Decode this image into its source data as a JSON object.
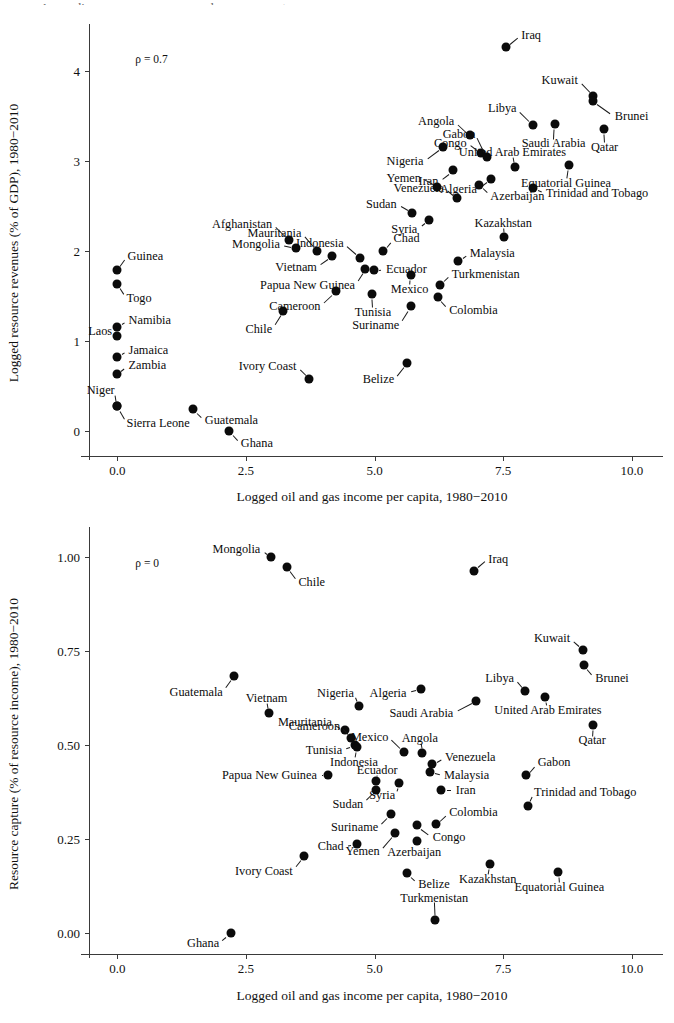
{
  "figure": {
    "cropped_title_sliver": "Appendix: resource revenues and resource capture"
  },
  "charts": [
    {
      "id": "top",
      "rho_label": "ρ = 0.7",
      "xlabel": "Logged oil and gas income per capita, 1980−2010",
      "ylabel": "Logged resource revenues (% of GDP), 1980−2010",
      "xticks": [
        "0.0",
        "2.5",
        "5.0",
        "7.5",
        "10.0"
      ],
      "yticks": [
        "0",
        "1",
        "2",
        "3",
        "4"
      ]
    },
    {
      "id": "bottom",
      "rho_label": "ρ = 0",
      "xlabel": "Logged oil and gas income per capita, 1980−2010",
      "ylabel": "Resource capture (% of resource income), 1980−2010",
      "xticks": [
        "0.0",
        "2.5",
        "5.0",
        "7.5",
        "10.0"
      ],
      "yticks": [
        "0.00",
        "0.25",
        "0.50",
        "0.75",
        "1.00"
      ]
    }
  ],
  "chart_data": [
    {
      "type": "scatter",
      "id": "logged-resource-revenues",
      "title": "",
      "xlabel": "Logged oil and gas income per capita, 1980−2010",
      "ylabel": "Logged resource revenues (% of GDP), 1980−2010",
      "xlim": [
        -0.55,
        10.45
      ],
      "ylim": [
        -0.28,
        4.45
      ],
      "xticks": [
        0.0,
        2.5,
        5.0,
        7.5,
        10.0
      ],
      "yticks": [
        0,
        1,
        2,
        3,
        4
      ],
      "grid": false,
      "legend": null,
      "annotations": [
        {
          "text": "ρ = 0.7",
          "x": 0.35,
          "y": 4.2
        }
      ],
      "points": [
        {
          "label": "Iraq",
          "x": 7.55,
          "y": 4.26,
          "lx": 0.3,
          "ly": 0.14,
          "anchor": "w"
        },
        {
          "label": "Kuwait",
          "x": 9.25,
          "y": 3.72,
          "lx": -0.3,
          "ly": 0.18,
          "anchor": "e"
        },
        {
          "label": "Brunei",
          "x": 9.25,
          "y": 3.66,
          "lx": 0.42,
          "ly": -0.17,
          "anchor": "w"
        },
        {
          "label": "Libya",
          "x": 8.08,
          "y": 3.4,
          "lx": -0.32,
          "ly": 0.18,
          "anchor": "e"
        },
        {
          "label": "Saudi Arabia",
          "x": 8.5,
          "y": 3.41,
          "lx": -0.02,
          "ly": -0.22,
          "anchor": "c"
        },
        {
          "label": "Qatar",
          "x": 9.45,
          "y": 3.35,
          "lx": 0.02,
          "ly": -0.2,
          "anchor": "c"
        },
        {
          "label": "Angola",
          "x": 6.85,
          "y": 3.28,
          "lx": -0.3,
          "ly": 0.16,
          "anchor": "e"
        },
        {
          "label": "Congo",
          "x": 7.07,
          "y": 3.08,
          "lx": -0.28,
          "ly": 0.12,
          "anchor": "e"
        },
        {
          "label": "Gabon",
          "x": 7.18,
          "y": 3.04,
          "lx": -0.22,
          "ly": 0.26,
          "anchor": "e"
        },
        {
          "label": "Nigeria",
          "x": 6.33,
          "y": 3.15,
          "lx": -0.38,
          "ly": -0.16,
          "anchor": "e"
        },
        {
          "label": "United Arab Emirates",
          "x": 7.73,
          "y": 2.93,
          "lx": -0.05,
          "ly": 0.16,
          "anchor": "c"
        },
        {
          "label": "Equatorial Guinea",
          "x": 8.77,
          "y": 2.95,
          "lx": -0.05,
          "ly": -0.2,
          "anchor": "c"
        },
        {
          "label": "Algeria",
          "x": 7.27,
          "y": 2.8,
          "lx": -0.28,
          "ly": -0.12,
          "anchor": "e"
        },
        {
          "label": "Azerbaijan",
          "x": 7.03,
          "y": 2.73,
          "lx": 0.22,
          "ly": -0.12,
          "anchor": "w"
        },
        {
          "label": "Iran",
          "x": 6.52,
          "y": 2.89,
          "lx": -0.28,
          "ly": -0.12,
          "anchor": "e"
        },
        {
          "label": "Yemen",
          "x": 6.22,
          "y": 2.71,
          "lx": -0.32,
          "ly": 0.1,
          "anchor": "e"
        },
        {
          "label": "Trinidad and Tobago",
          "x": 8.08,
          "y": 2.7,
          "lx": 0.25,
          "ly": -0.06,
          "anchor": "w"
        },
        {
          "label": "Venezuela",
          "x": 6.6,
          "y": 2.58,
          "lx": -0.25,
          "ly": 0.12,
          "anchor": "e"
        },
        {
          "label": "Sudan",
          "x": 5.73,
          "y": 2.42,
          "lx": -0.3,
          "ly": 0.1,
          "anchor": "e"
        },
        {
          "label": "Syria",
          "x": 6.05,
          "y": 2.34,
          "lx": -0.22,
          "ly": -0.1,
          "anchor": "e"
        },
        {
          "label": "Kazakhstan",
          "x": 7.52,
          "y": 2.15,
          "lx": -0.02,
          "ly": 0.16,
          "anchor": "c"
        },
        {
          "label": "Afghanistan",
          "x": 3.33,
          "y": 2.12,
          "lx": -0.32,
          "ly": 0.18,
          "anchor": "e"
        },
        {
          "label": "Mongolia",
          "x": 3.48,
          "y": 2.03,
          "lx": -0.32,
          "ly": 0.04,
          "anchor": "e"
        },
        {
          "label": "Mauritania",
          "x": 3.88,
          "y": 2.0,
          "lx": -0.3,
          "ly": 0.2,
          "anchor": "e"
        },
        {
          "label": "Vietnam",
          "x": 4.18,
          "y": 1.94,
          "lx": -0.3,
          "ly": -0.12,
          "anchor": "e"
        },
        {
          "label": "Indonesia",
          "x": 4.72,
          "y": 1.92,
          "lx": -0.32,
          "ly": 0.16,
          "anchor": "e"
        },
        {
          "label": "Chad",
          "x": 5.17,
          "y": 2.0,
          "lx": 0.2,
          "ly": 0.14,
          "anchor": "w"
        },
        {
          "label": "Guinea",
          "x": 0.0,
          "y": 1.78,
          "lx": 0.2,
          "ly": 0.16,
          "anchor": "w"
        },
        {
          "label": "Togo",
          "x": 0.0,
          "y": 1.63,
          "lx": 0.18,
          "ly": -0.16,
          "anchor": "w"
        },
        {
          "label": "Ecuador",
          "x": 4.98,
          "y": 1.78,
          "lx": 0.24,
          "ly": 0.02,
          "anchor": "w"
        },
        {
          "label": "Malaysia",
          "x": 6.63,
          "y": 1.88,
          "lx": 0.22,
          "ly": 0.09,
          "anchor": "w"
        },
        {
          "label": "Papua New Guinea",
          "x": 4.82,
          "y": 1.8,
          "lx": -0.2,
          "ly": -0.18,
          "anchor": "e"
        },
        {
          "label": "Mexico",
          "x": 5.7,
          "y": 1.73,
          "lx": -0.02,
          "ly": -0.16,
          "anchor": "c"
        },
        {
          "label": "Turkmenistan",
          "x": 6.28,
          "y": 1.62,
          "lx": 0.22,
          "ly": 0.12,
          "anchor": "w"
        },
        {
          "label": "Namibia",
          "x": 0.0,
          "y": 1.15,
          "lx": 0.22,
          "ly": 0.08,
          "anchor": "w"
        },
        {
          "label": "Laos",
          "x": 0.0,
          "y": 1.05,
          "lx": -0.1,
          "ly": 0.06,
          "anchor": "e"
        },
        {
          "label": "Cameroon",
          "x": 4.25,
          "y": 1.55,
          "lx": -0.3,
          "ly": -0.16,
          "anchor": "e"
        },
        {
          "label": "Tunisia",
          "x": 4.95,
          "y": 1.52,
          "lx": 0.02,
          "ly": -0.2,
          "anchor": "c"
        },
        {
          "label": "Colombia",
          "x": 6.23,
          "y": 1.48,
          "lx": 0.22,
          "ly": -0.14,
          "anchor": "w"
        },
        {
          "label": "Chile",
          "x": 3.23,
          "y": 1.33,
          "lx": -0.22,
          "ly": -0.2,
          "anchor": "e"
        },
        {
          "label": "Suriname",
          "x": 5.7,
          "y": 1.38,
          "lx": -0.22,
          "ly": -0.2,
          "anchor": "e"
        },
        {
          "label": "Jamaica",
          "x": 0.0,
          "y": 0.82,
          "lx": 0.22,
          "ly": 0.08,
          "anchor": "w"
        },
        {
          "label": "Zambia",
          "x": 0.0,
          "y": 0.63,
          "lx": 0.22,
          "ly": 0.1,
          "anchor": "w"
        },
        {
          "label": "Belize",
          "x": 5.63,
          "y": 0.75,
          "lx": -0.25,
          "ly": -0.18,
          "anchor": "e"
        },
        {
          "label": "Ivory Coast",
          "x": 3.73,
          "y": 0.58,
          "lx": -0.25,
          "ly": 0.14,
          "anchor": "e"
        },
        {
          "label": "Niger",
          "x": 0.0,
          "y": 0.27,
          "lx": -0.05,
          "ly": 0.18,
          "anchor": "e"
        },
        {
          "label": "Sierra Leone",
          "x": 0.0,
          "y": 0.27,
          "lx": 0.18,
          "ly": -0.18,
          "anchor": "w"
        },
        {
          "label": "Guatemala",
          "x": 1.48,
          "y": 0.24,
          "lx": 0.22,
          "ly": -0.12,
          "anchor": "w"
        },
        {
          "label": "Ghana",
          "x": 2.18,
          "y": 0.0,
          "lx": 0.22,
          "ly": -0.14,
          "anchor": "w"
        }
      ]
    },
    {
      "type": "scatter",
      "id": "resource-capture",
      "title": "",
      "xlabel": "Logged oil and gas income per capita, 1980−2010",
      "ylabel": "Resource capture (% of resource income), 1980−2010",
      "xlim": [
        -0.55,
        10.45
      ],
      "ylim": [
        -0.055,
        1.065
      ],
      "xticks": [
        0.0,
        2.5,
        5.0,
        7.5,
        10.0
      ],
      "yticks": [
        0.0,
        0.25,
        0.5,
        0.75,
        1.0
      ],
      "grid": false,
      "legend": null,
      "annotations": [
        {
          "text": "ρ = 0",
          "x": 0.35,
          "y": 1.0
        }
      ],
      "points": [
        {
          "label": "Mongolia",
          "x": 2.98,
          "y": 1.0,
          "lx": -0.2,
          "ly": 0.022,
          "anchor": "e"
        },
        {
          "label": "Chile",
          "x": 3.3,
          "y": 0.975,
          "lx": 0.22,
          "ly": -0.04,
          "anchor": "w"
        },
        {
          "label": "Iraq",
          "x": 6.93,
          "y": 0.965,
          "lx": 0.28,
          "ly": 0.032,
          "anchor": "w"
        },
        {
          "label": "Kuwait",
          "x": 9.05,
          "y": 0.755,
          "lx": -0.25,
          "ly": 0.03,
          "anchor": "e"
        },
        {
          "label": "Brunei",
          "x": 9.07,
          "y": 0.715,
          "lx": 0.22,
          "ly": -0.035,
          "anchor": "w"
        },
        {
          "label": "Guatemala",
          "x": 2.27,
          "y": 0.685,
          "lx": -0.22,
          "ly": -0.042,
          "anchor": "e"
        },
        {
          "label": "Libya",
          "x": 7.93,
          "y": 0.645,
          "lx": -0.22,
          "ly": 0.035,
          "anchor": "e"
        },
        {
          "label": "Algeria",
          "x": 5.9,
          "y": 0.65,
          "lx": -0.28,
          "ly": -0.01,
          "anchor": "e"
        },
        {
          "label": "Nigeria",
          "x": 4.7,
          "y": 0.605,
          "lx": -0.1,
          "ly": 0.035,
          "anchor": "e"
        },
        {
          "label": "United Arab Emirates",
          "x": 8.32,
          "y": 0.63,
          "lx": 0.05,
          "ly": -0.035,
          "anchor": "c"
        },
        {
          "label": "Saudi Arabia",
          "x": 6.98,
          "y": 0.618,
          "lx": -0.45,
          "ly": -0.032,
          "anchor": "e"
        },
        {
          "label": "Vietnam",
          "x": 2.95,
          "y": 0.585,
          "lx": -0.05,
          "ly": 0.04,
          "anchor": "c"
        },
        {
          "label": "Qatar",
          "x": 9.25,
          "y": 0.555,
          "lx": -0.02,
          "ly": -0.042,
          "anchor": "c"
        },
        {
          "label": "Mauritania",
          "x": 4.42,
          "y": 0.54,
          "lx": -0.25,
          "ly": 0.022,
          "anchor": "e"
        },
        {
          "label": "Cameroon",
          "x": 4.55,
          "y": 0.52,
          "lx": -0.22,
          "ly": 0.032,
          "anchor": "e"
        },
        {
          "label": "Mexico",
          "x": 5.57,
          "y": 0.483,
          "lx": -0.3,
          "ly": 0.04,
          "anchor": "e"
        },
        {
          "label": "Angola",
          "x": 5.93,
          "y": 0.48,
          "lx": -0.05,
          "ly": 0.04,
          "anchor": "c"
        },
        {
          "label": "Tunisia",
          "x": 4.62,
          "y": 0.5,
          "lx": -0.25,
          "ly": -0.012,
          "anchor": "e"
        },
        {
          "label": "Indonesia",
          "x": 4.65,
          "y": 0.495,
          "lx": -0.05,
          "ly": -0.038,
          "anchor": "c"
        },
        {
          "label": "Venezuela",
          "x": 6.12,
          "y": 0.45,
          "lx": 0.25,
          "ly": 0.02,
          "anchor": "w"
        },
        {
          "label": "Gabon",
          "x": 7.95,
          "y": 0.42,
          "lx": 0.22,
          "ly": 0.035,
          "anchor": "w"
        },
        {
          "label": "Malaysia",
          "x": 6.07,
          "y": 0.43,
          "lx": 0.28,
          "ly": -0.01,
          "anchor": "w"
        },
        {
          "label": "Papua New Guinea",
          "x": 4.1,
          "y": 0.42,
          "lx": -0.22,
          "ly": 0.0,
          "anchor": "e"
        },
        {
          "label": "Ecuador",
          "x": 5.03,
          "y": 0.405,
          "lx": 0.02,
          "ly": 0.03,
          "anchor": "c"
        },
        {
          "label": "Syria",
          "x": 5.48,
          "y": 0.4,
          "lx": -0.08,
          "ly": -0.032,
          "anchor": "e"
        },
        {
          "label": "Iran",
          "x": 6.3,
          "y": 0.38,
          "lx": 0.28,
          "ly": 0.0,
          "anchor": "w"
        },
        {
          "label": "Trinidad and Tobago",
          "x": 7.98,
          "y": 0.34,
          "lx": 0.12,
          "ly": 0.035,
          "anchor": "w"
        },
        {
          "label": "Sudan",
          "x": 5.03,
          "y": 0.38,
          "lx": -0.25,
          "ly": -0.035,
          "anchor": "e"
        },
        {
          "label": "Colombia",
          "x": 6.2,
          "y": 0.29,
          "lx": 0.25,
          "ly": 0.032,
          "anchor": "w"
        },
        {
          "label": "Congo",
          "x": 5.83,
          "y": 0.287,
          "lx": 0.3,
          "ly": -0.03,
          "anchor": "w"
        },
        {
          "label": "Suriname",
          "x": 5.32,
          "y": 0.318,
          "lx": -0.25,
          "ly": -0.035,
          "anchor": "e"
        },
        {
          "label": "Azerbaijan",
          "x": 5.82,
          "y": 0.245,
          "lx": -0.05,
          "ly": -0.028,
          "anchor": "c"
        },
        {
          "label": "Chad",
          "x": 4.65,
          "y": 0.238,
          "lx": -0.25,
          "ly": -0.005,
          "anchor": "e"
        },
        {
          "label": "Yemen",
          "x": 5.4,
          "y": 0.268,
          "lx": -0.3,
          "ly": -0.048,
          "anchor": "e"
        },
        {
          "label": "Ivory Coast",
          "x": 3.63,
          "y": 0.205,
          "lx": -0.22,
          "ly": -0.038,
          "anchor": "e"
        },
        {
          "label": "Kazakhstan",
          "x": 7.25,
          "y": 0.185,
          "lx": -0.05,
          "ly": -0.04,
          "anchor": "c"
        },
        {
          "label": "Belize",
          "x": 5.63,
          "y": 0.16,
          "lx": 0.22,
          "ly": -0.028,
          "anchor": "w"
        },
        {
          "label": "Equatorial Guinea",
          "x": 8.57,
          "y": 0.163,
          "lx": 0.02,
          "ly": -0.04,
          "anchor": "c"
        },
        {
          "label": "Turkmenistan",
          "x": 6.18,
          "y": 0.035,
          "lx": -0.02,
          "ly": 0.06,
          "anchor": "c"
        },
        {
          "label": "Ghana",
          "x": 2.2,
          "y": 0.0,
          "lx": -0.22,
          "ly": -0.025,
          "anchor": "e"
        }
      ]
    }
  ]
}
